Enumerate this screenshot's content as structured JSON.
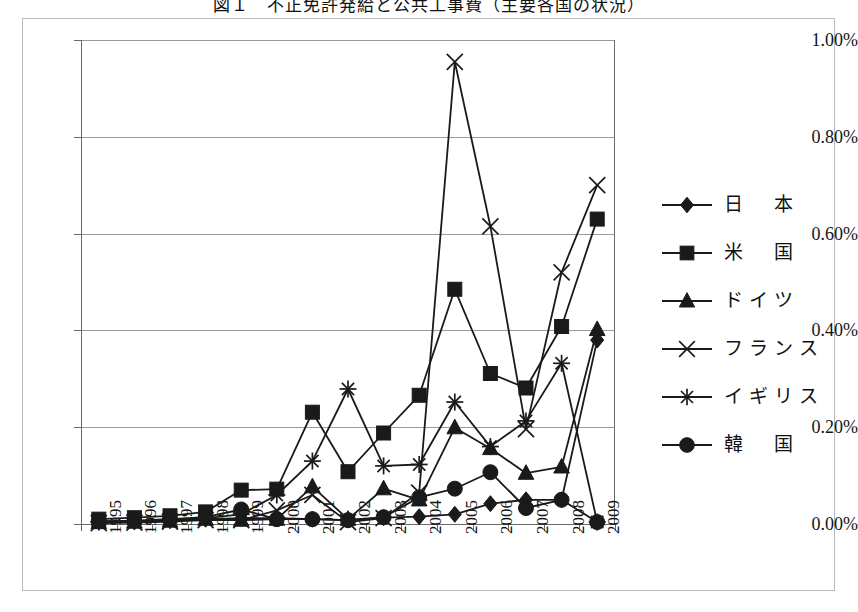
{
  "title": "図１　不正免許発給と公共工事費（主要各国の状況）",
  "chart_data": {
    "type": "line",
    "title": "図１　不正免許発給と公共工事費（主要各国の状況）",
    "xlabel": "",
    "ylabel": "",
    "grid": true,
    "legend_position": "right",
    "ylim": [
      0,
      1.0
    ],
    "yticks": [
      "0.00%",
      "0.20%",
      "0.40%",
      "0.60%",
      "0.80%",
      "1.00%"
    ],
    "ytick_values": [
      0.0,
      0.2,
      0.4,
      0.6,
      0.8,
      1.0
    ],
    "categories": [
      "1995",
      "1996",
      "1997",
      "1998",
      "1999",
      "2000",
      "2001",
      "2002",
      "2003",
      "2004",
      "2005",
      "2006",
      "2007",
      "2008",
      "2009"
    ],
    "series": [
      {
        "name": "日　本",
        "marker": "diamond",
        "values": [
          0.005,
          0.005,
          0.008,
          0.01,
          0.012,
          0.012,
          0.01,
          0.008,
          0.013,
          0.015,
          0.02,
          0.042,
          0.05,
          0.05,
          0.38
        ]
      },
      {
        "name": "米　国",
        "marker": "square",
        "values": [
          0.01,
          0.013,
          0.017,
          0.025,
          0.07,
          0.072,
          0.231,
          0.108,
          0.188,
          0.266,
          0.485,
          0.311,
          0.281,
          0.408,
          0.63
        ]
      },
      {
        "name": "ドイツ",
        "marker": "triangle",
        "values": [
          0.003,
          0.004,
          0.006,
          0.01,
          0.008,
          0.01,
          0.077,
          0.01,
          0.073,
          0.05,
          0.199,
          0.156,
          0.105,
          0.118,
          0.402
        ]
      },
      {
        "name": "フランス",
        "marker": "cross",
        "values": [
          0.002,
          0.003,
          0.005,
          0.008,
          0.008,
          0.028,
          0.06,
          0.004,
          0.012,
          0.065,
          0.955,
          0.615,
          0.196,
          0.52,
          0.7
        ]
      },
      {
        "name": "イギリス",
        "marker": "asterisk",
        "values": [
          0.004,
          0.005,
          0.008,
          0.012,
          0.02,
          0.06,
          0.13,
          0.279,
          0.12,
          0.123,
          0.252,
          0.16,
          0.213,
          0.332,
          0.004
        ]
      },
      {
        "name": "韓　国",
        "marker": "circle",
        "values": [
          0.006,
          0.007,
          0.01,
          0.014,
          0.03,
          0.01,
          0.01,
          0.008,
          0.014,
          0.055,
          0.073,
          0.107,
          0.033,
          0.05,
          0.004
        ]
      }
    ]
  },
  "legend": {
    "items": [
      {
        "label": "日　本",
        "marker": "diamond"
      },
      {
        "label": "米　国",
        "marker": "square"
      },
      {
        "label": "ドイツ",
        "marker": "triangle"
      },
      {
        "label": "フランス",
        "marker": "cross"
      },
      {
        "label": "イギリス",
        "marker": "asterisk"
      },
      {
        "label": "韓　国",
        "marker": "circle"
      }
    ]
  },
  "colors": {
    "line": "#1a1a1a",
    "grid": "#9a9a9a",
    "axis": "#6a6a6a",
    "frame": "#b9b9b9",
    "text": "#141414",
    "background": "#ffffff"
  }
}
